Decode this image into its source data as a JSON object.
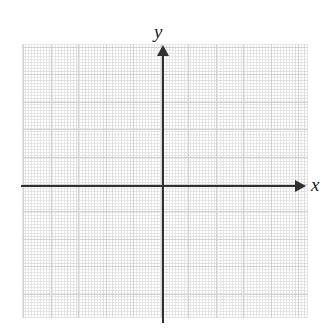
{
  "figure": {
    "type": "coordinate-plane",
    "title": "",
    "background_color": "#ffffff",
    "axis_color": "#303030",
    "grid_color": "#d8d8d8",
    "grid": {
      "visible": true,
      "style": "dotted",
      "minor_spacing_px": 9.2,
      "major_spacing_px": 27.5,
      "region": {
        "left": 22,
        "top": 44,
        "width": 286,
        "height": 274
      }
    },
    "origin": {
      "x": 163,
      "y": 186
    },
    "axes": [
      {
        "name": "x-axis",
        "label": "x",
        "orientation": "horizontal",
        "arrow": "right",
        "ticks": [],
        "tick_labels": []
      },
      {
        "name": "y-axis",
        "label": "y",
        "orientation": "vertical",
        "arrow": "up",
        "ticks": [],
        "tick_labels": []
      }
    ]
  },
  "chart_data": {
    "type": "scatter",
    "title": "",
    "xlabel": "x",
    "ylabel": "y",
    "x": [],
    "y": [],
    "series": [],
    "grid": true,
    "legend": null,
    "annotations": [],
    "xlim": [
      -6,
      5
    ],
    "ylim": [
      -5,
      5
    ]
  }
}
